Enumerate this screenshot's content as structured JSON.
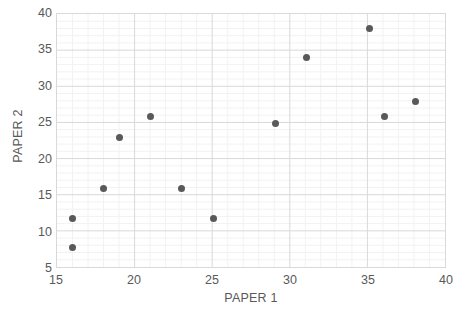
{
  "chart_data": {
    "type": "scatter",
    "title": "",
    "xlabel": "PAPER 1",
    "ylabel": "PAPER 2",
    "xlim": [
      15,
      40
    ],
    "ylim": [
      5,
      40
    ],
    "xticks": [
      15,
      20,
      25,
      30,
      35,
      40
    ],
    "yticks": [
      5,
      10,
      15,
      20,
      25,
      30,
      35,
      40
    ],
    "grid": true,
    "minor_grid": true,
    "legend": "none",
    "x": [
      16,
      16,
      18,
      19,
      21,
      23,
      25,
      29,
      31,
      35,
      36,
      38
    ],
    "y": [
      8,
      12,
      16,
      23,
      26,
      16,
      12,
      25,
      34,
      38,
      26,
      28
    ],
    "points": [
      {
        "x": 16,
        "y": 8
      },
      {
        "x": 16,
        "y": 12
      },
      {
        "x": 18,
        "y": 16
      },
      {
        "x": 19,
        "y": 23
      },
      {
        "x": 21,
        "y": 26
      },
      {
        "x": 23,
        "y": 16
      },
      {
        "x": 25,
        "y": 12
      },
      {
        "x": 29,
        "y": 25
      },
      {
        "x": 31,
        "y": 34
      },
      {
        "x": 35,
        "y": 38
      },
      {
        "x": 36,
        "y": 26
      },
      {
        "x": 38,
        "y": 28
      }
    ],
    "marker_color": "#595959",
    "major_gridline_color": "#d9d9d9",
    "minor_gridline_color": "#f2f2f2",
    "plot_border_color": "#d9d9d9",
    "background_color": "#ffffff",
    "major_x_gridlines": [
      20,
      25,
      30,
      35
    ],
    "major_y_gridlines": [
      10,
      15,
      20,
      25,
      30,
      35
    ],
    "minor_x_step": 1,
    "minor_y_step": 1
  }
}
